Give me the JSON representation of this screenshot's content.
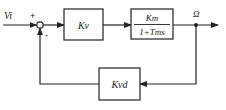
{
  "diagram": {
    "type": "block-diagram",
    "input": {
      "label": "Vi"
    },
    "summing_junction": {
      "plus_sign": "+",
      "minus_sign": "-"
    },
    "blocks": [
      {
        "id": "kv",
        "label": "Kv"
      },
      {
        "id": "plant",
        "numerator": "Km",
        "denominator": "1+Tms"
      },
      {
        "id": "kvd",
        "label": "Kvd"
      }
    ],
    "output": {
      "label": "Ω"
    },
    "colors": {
      "stroke": "#222222",
      "background": "#ffffff"
    }
  }
}
